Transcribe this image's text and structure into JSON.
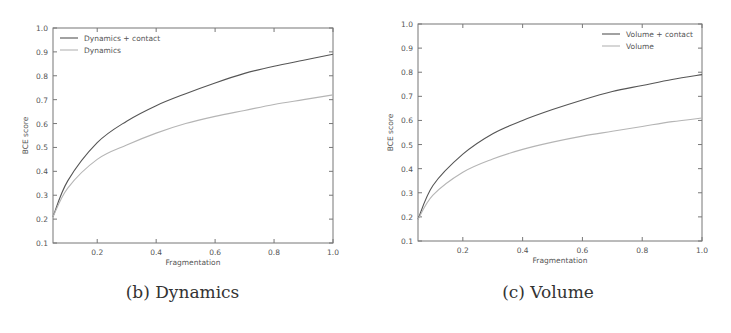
{
  "chart_data": [
    {
      "type": "line",
      "caption": "(b) Dynamics",
      "title": "",
      "xlabel": "Fragmentation",
      "ylabel": "BCE score",
      "xlim": [
        0.05,
        1.0
      ],
      "ylim": [
        0.1,
        1.0
      ],
      "xticks": [
        "0.2",
        "0.4",
        "0.6",
        "0.8",
        "1.0"
      ],
      "yticks": [
        "0.1",
        "0.2",
        "0.3",
        "0.4",
        "0.5",
        "0.6",
        "0.7",
        "0.8",
        "0.9",
        "1.0"
      ],
      "grid": false,
      "legend_position": "upper left",
      "x": [
        0.05,
        0.1,
        0.2,
        0.3,
        0.4,
        0.5,
        0.6,
        0.7,
        0.8,
        0.9,
        1.0
      ],
      "series": [
        {
          "name": "Dynamics + contact",
          "color": "#555555",
          "values": [
            0.21,
            0.36,
            0.52,
            0.61,
            0.675,
            0.725,
            0.77,
            0.81,
            0.84,
            0.865,
            0.89
          ]
        },
        {
          "name": "Dynamics",
          "color": "#b5b5b5",
          "values": [
            0.21,
            0.33,
            0.45,
            0.51,
            0.56,
            0.6,
            0.63,
            0.655,
            0.68,
            0.7,
            0.72
          ]
        }
      ]
    },
    {
      "type": "line",
      "caption": "(c) Volume",
      "title": "",
      "xlabel": "Fragmentation",
      "ylabel": "BCE score",
      "xlim": [
        0.05,
        1.0
      ],
      "ylim": [
        0.1,
        1.0
      ],
      "xticks": [
        "0.2",
        "0.4",
        "0.6",
        "0.8",
        "1.0"
      ],
      "yticks": [
        "0.1",
        "0.2",
        "0.3",
        "0.4",
        "0.5",
        "0.6",
        "0.7",
        "0.8",
        "0.9",
        "1.0"
      ],
      "grid": false,
      "legend_position": "upper right",
      "x": [
        0.05,
        0.1,
        0.2,
        0.3,
        0.4,
        0.5,
        0.6,
        0.7,
        0.8,
        0.9,
        1.0
      ],
      "series": [
        {
          "name": "Volume + contact",
          "color": "#555555",
          "values": [
            0.19,
            0.33,
            0.46,
            0.545,
            0.6,
            0.645,
            0.685,
            0.72,
            0.745,
            0.77,
            0.79
          ]
        },
        {
          "name": "Volume",
          "color": "#b5b5b5",
          "values": [
            0.19,
            0.29,
            0.385,
            0.44,
            0.48,
            0.51,
            0.535,
            0.555,
            0.575,
            0.595,
            0.61
          ]
        }
      ]
    }
  ]
}
